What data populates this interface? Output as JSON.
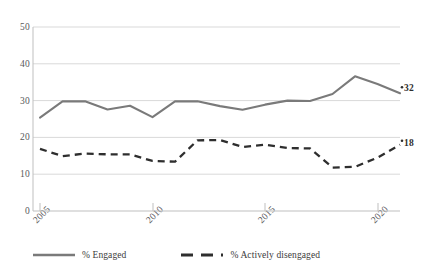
{
  "chart_data": {
    "type": "line",
    "title": "",
    "subtitle": "",
    "xlabel": "",
    "ylabel": "",
    "xlim": [
      2005,
      2021
    ],
    "ylim": [
      0,
      50
    ],
    "grid": "horizontal",
    "legend_position": "bottom-left",
    "x": [
      2005,
      2006,
      2007,
      2008,
      2009,
      2010,
      2011,
      2012,
      2013,
      2014,
      2015,
      2016,
      2017,
      2018,
      2019,
      2020,
      2021
    ],
    "x_tick_values": [
      2005,
      2010,
      2015,
      2020
    ],
    "x_tick_labels": [
      "2005",
      "2010",
      "2015",
      "2020"
    ],
    "y_tick_values": [
      0,
      10,
      20,
      30,
      40,
      50
    ],
    "y_tick_labels": [
      "0",
      "10",
      "20",
      "30",
      "40",
      "50"
    ],
    "series": [
      {
        "name": "% Engaged",
        "style": "solid",
        "color": "#7a7a7a",
        "values": [
          25.4,
          29.8,
          29.8,
          27.6,
          28.6,
          25.5,
          29.8,
          29.8,
          28.5,
          27.5,
          28.9,
          30.0,
          29.9,
          31.8,
          33.2,
          33.1,
          34.9
        ],
        "end_label": "32"
      },
      {
        "name": "% Actively disengaged",
        "style": "dashed",
        "color": "#2e2e2e",
        "values": [
          16.9,
          14.9,
          15.6,
          15.4,
          15.4,
          13.6,
          13.4,
          19.2,
          19.3,
          17.4,
          18.0,
          17.1,
          17.0,
          18.0,
          16.2,
          15.5,
          13.6
        ],
        "end_label": "18"
      }
    ],
    "series_tail": {
      "engaged_last_years": [
        2019,
        2020,
        2021
      ],
      "engaged_last_values": [
        36.6,
        34.5,
        32.0
      ],
      "disengaged_last_years": [
        2018,
        2019,
        2020,
        2021
      ],
      "disengaged_last_values": [
        11.8,
        12.0,
        14.5,
        18.0
      ]
    },
    "annotations": [
      {
        "text": "32",
        "series": "% Engaged"
      },
      {
        "text": "18",
        "series": "% Actively disengaged"
      }
    ]
  },
  "legend": {
    "items": [
      {
        "label": "% Engaged"
      },
      {
        "label": "% Actively disengaged"
      }
    ]
  },
  "axis": {
    "y_labels": [
      "50",
      "40",
      "30",
      "20",
      "10",
      "0"
    ],
    "x_labels": [
      "2005",
      "2010",
      "2015",
      "2020"
    ]
  },
  "colors": {
    "engaged_line": "#7a7a7a",
    "disengaged_line": "#2e2e2e",
    "gridline": "#d9d9d9",
    "axis": "#bfbfbf",
    "text": "#58585a"
  }
}
